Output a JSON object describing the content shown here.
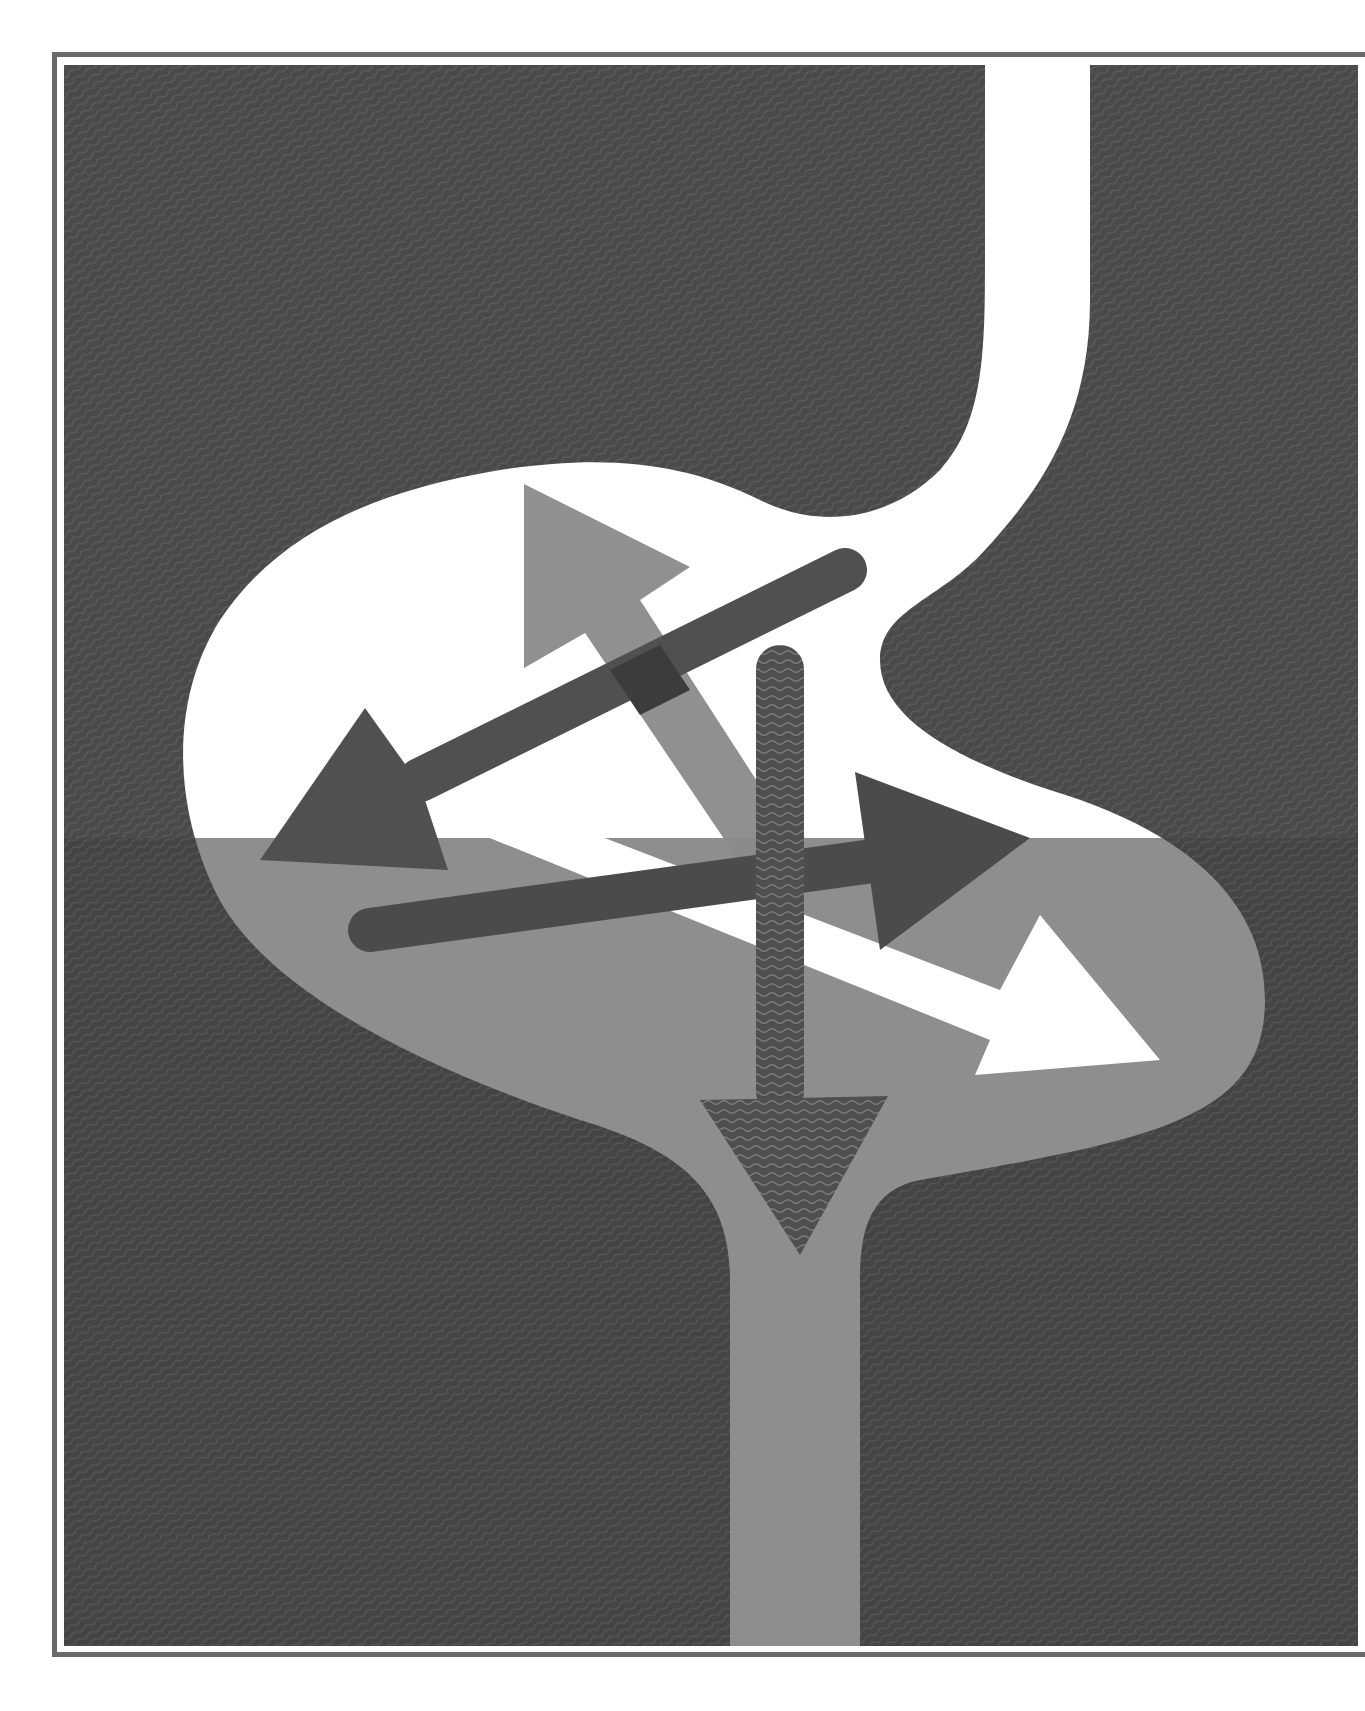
{
  "artwork": {
    "subject": "stylized stomach with crossing arrows",
    "colors": {
      "background": "#ffffff",
      "frame": "#6a6a6a",
      "panel_dark": "#4a4a4a",
      "panel_dark_lower": "#434343",
      "vessel_upper": "#ffffff",
      "vessel_lower": "#8e8e8e",
      "arrow_dark": "#4e4e4e",
      "arrow_mid": "#8a8a8a",
      "arrow_white": "#ffffff",
      "overlap": "#3c3c3c",
      "wave_line": "#6e6e6e"
    },
    "split_line_y": 838,
    "elements": [
      {
        "name": "upper-left-arrow",
        "direction": "up-left",
        "tone": "mid-gray"
      },
      {
        "name": "down-left-arrow",
        "direction": "down-left",
        "tone": "dark-gray"
      },
      {
        "name": "down-arrow",
        "direction": "down",
        "tone": "wavy-dark"
      },
      {
        "name": "right-arrow",
        "direction": "right",
        "tone": "dark-gray"
      },
      {
        "name": "down-right-arrow",
        "direction": "down-right",
        "tone": "white"
      }
    ]
  }
}
